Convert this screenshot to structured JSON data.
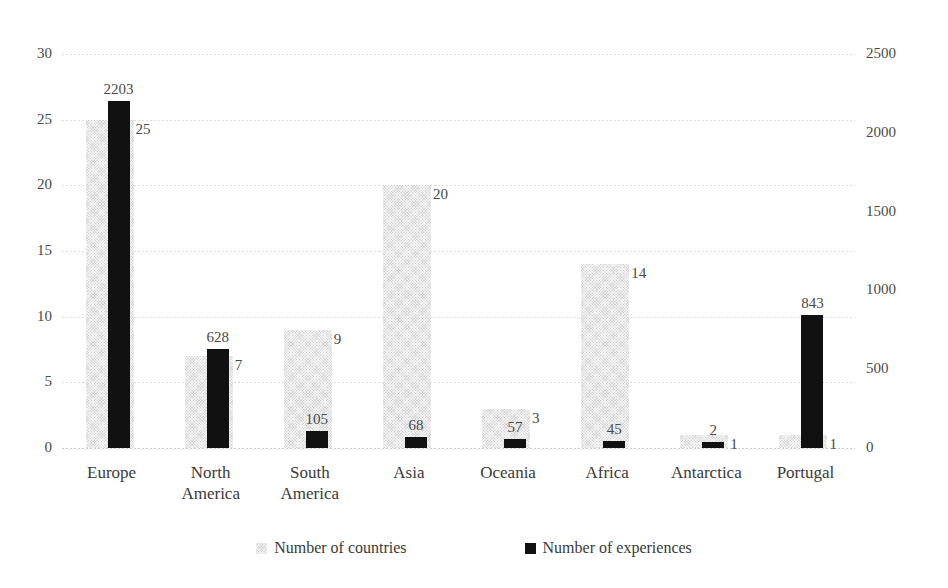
{
  "chart_data": {
    "type": "bar",
    "title": "",
    "xlabel": "",
    "ylabel": "",
    "categories": [
      "Europe",
      "North America",
      "South America",
      "Asia",
      "Oceania",
      "Africa",
      "Antarctica",
      "Portugal"
    ],
    "series": [
      {
        "name": "Number of countries",
        "axis": "left",
        "color": "#d2d2d2",
        "values": [
          25,
          7,
          9,
          20,
          3,
          14,
          1,
          1
        ]
      },
      {
        "name": "Number of experiences",
        "axis": "right",
        "color": "#111111",
        "values": [
          2203,
          628,
          105,
          68,
          57,
          45,
          2,
          843
        ]
      }
    ],
    "left_axis": {
      "ticks": [
        "0",
        "5",
        "10",
        "15",
        "20",
        "25",
        "30"
      ],
      "ylim": [
        0,
        30
      ]
    },
    "right_axis": {
      "ticks": [
        "0",
        "500",
        "1000",
        "1500",
        "2000",
        "2500"
      ],
      "ylim": [
        0,
        2500
      ]
    },
    "grid": true,
    "legend_position": "bottom"
  },
  "legend": {
    "entries": [
      {
        "label": "Number of countries",
        "swatch": "countries-swatch"
      },
      {
        "label": "Number of experiences",
        "swatch": "experiences-swatch"
      }
    ]
  }
}
